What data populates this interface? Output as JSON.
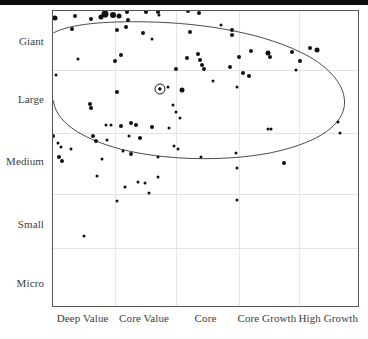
{
  "chart_data": {
    "type": "scatter",
    "title": "",
    "subtitle": "",
    "xlabel": "",
    "ylabel": "",
    "x_tick_labels": [
      "Deep Value",
      "Core Value",
      "Core",
      "Core Growth",
      "High Growth"
    ],
    "y_tick_labels": [
      "Giant",
      "Large",
      "Medium",
      "Small",
      "Micro"
    ],
    "grid": true,
    "legend_position": "none",
    "xlim": [
      0,
      5
    ],
    "ylim": [
      0,
      5
    ],
    "annotations": [
      {
        "name": "ownership-zone-ellipse",
        "shape": "ellipse",
        "description": "Open curve outlining holdings concentration across Giant/Large caps"
      },
      {
        "name": "highlighted-holding",
        "shape": "ring-marker",
        "x": 1.75,
        "y": 3.68,
        "description": "Circled data point marking the selected security"
      }
    ],
    "points": [
      {
        "x": 0.04,
        "y": 4.88,
        "size": 5
      },
      {
        "x": 0.36,
        "y": 4.92,
        "size": 4
      },
      {
        "x": 0.31,
        "y": 4.7,
        "size": 4
      },
      {
        "x": 0.62,
        "y": 4.86,
        "size": 4
      },
      {
        "x": 0.78,
        "y": 4.9,
        "size": 5
      },
      {
        "x": 0.85,
        "y": 4.95,
        "size": 7
      },
      {
        "x": 0.99,
        "y": 4.93,
        "size": 6
      },
      {
        "x": 1.08,
        "y": 4.92,
        "size": 5
      },
      {
        "x": 1.22,
        "y": 4.99,
        "size": 4
      },
      {
        "x": 1.23,
        "y": 4.84,
        "size": 4
      },
      {
        "x": 1.52,
        "y": 4.98,
        "size": 4
      },
      {
        "x": 1.72,
        "y": 4.99,
        "size": 4
      },
      {
        "x": 1.73,
        "y": 4.93,
        "size": 3
      },
      {
        "x": 2.22,
        "y": 5.0,
        "size": 4
      },
      {
        "x": 2.4,
        "y": 4.96,
        "size": 4
      },
      {
        "x": 1.05,
        "y": 4.68,
        "size": 4
      },
      {
        "x": 1.2,
        "y": 4.73,
        "size": 4
      },
      {
        "x": 1.48,
        "y": 4.62,
        "size": 4
      },
      {
        "x": 2.25,
        "y": 4.64,
        "size": 4
      },
      {
        "x": 2.75,
        "y": 4.76,
        "size": 3
      },
      {
        "x": 2.93,
        "y": 4.68,
        "size": 4
      },
      {
        "x": 2.94,
        "y": 4.6,
        "size": 4
      },
      {
        "x": 1.62,
        "y": 4.52,
        "size": 3
      },
      {
        "x": 0.41,
        "y": 4.18,
        "size": 3
      },
      {
        "x": 1.02,
        "y": 4.15,
        "size": 4
      },
      {
        "x": 1.12,
        "y": 4.25,
        "size": 4
      },
      {
        "x": 2.2,
        "y": 4.2,
        "size": 4
      },
      {
        "x": 2.38,
        "y": 4.27,
        "size": 4
      },
      {
        "x": 2.41,
        "y": 4.17,
        "size": 4
      },
      {
        "x": 2.44,
        "y": 4.08,
        "size": 4
      },
      {
        "x": 2.48,
        "y": 4.02,
        "size": 4
      },
      {
        "x": 3.05,
        "y": 4.22,
        "size": 4
      },
      {
        "x": 3.25,
        "y": 4.32,
        "size": 4
      },
      {
        "x": 3.52,
        "y": 4.29,
        "size": 5
      },
      {
        "x": 3.55,
        "y": 4.22,
        "size": 4
      },
      {
        "x": 3.92,
        "y": 4.3,
        "size": 4
      },
      {
        "x": 4.22,
        "y": 4.37,
        "size": 4
      },
      {
        "x": 4.33,
        "y": 4.34,
        "size": 5
      },
      {
        "x": 4.05,
        "y": 4.15,
        "size": 4
      },
      {
        "x": 1.75,
        "y": 3.68,
        "size": 3
      },
      {
        "x": 2.02,
        "y": 4.02,
        "size": 4
      },
      {
        "x": 2.9,
        "y": 4.05,
        "size": 4
      },
      {
        "x": 3.12,
        "y": 3.95,
        "size": 4
      },
      {
        "x": 3.22,
        "y": 3.9,
        "size": 4
      },
      {
        "x": 3.98,
        "y": 4.0,
        "size": 3
      },
      {
        "x": 2.62,
        "y": 3.82,
        "size": 3
      },
      {
        "x": 1.05,
        "y": 3.62,
        "size": 4
      },
      {
        "x": 1.88,
        "y": 3.72,
        "size": 3
      },
      {
        "x": 2.12,
        "y": 3.66,
        "size": 5
      },
      {
        "x": 3.02,
        "y": 3.72,
        "size": 3
      },
      {
        "x": 0.05,
        "y": 3.92,
        "size": 3
      },
      {
        "x": 0.6,
        "y": 3.42,
        "size": 4
      },
      {
        "x": 0.63,
        "y": 3.36,
        "size": 4
      },
      {
        "x": 1.97,
        "y": 3.4,
        "size": 3
      },
      {
        "x": 2.02,
        "y": 3.28,
        "size": 3
      },
      {
        "x": 0.87,
        "y": 3.06,
        "size": 3
      },
      {
        "x": 0.95,
        "y": 3.06,
        "size": 3
      },
      {
        "x": 1.12,
        "y": 3.05,
        "size": 4
      },
      {
        "x": 1.28,
        "y": 3.1,
        "size": 4
      },
      {
        "x": 1.36,
        "y": 3.06,
        "size": 4
      },
      {
        "x": 1.62,
        "y": 3.04,
        "size": 4
      },
      {
        "x": 1.9,
        "y": 3.02,
        "size": 3
      },
      {
        "x": 2.08,
        "y": 3.18,
        "size": 3
      },
      {
        "x": 3.52,
        "y": 3.0,
        "size": 3
      },
      {
        "x": 3.58,
        "y": 3.0,
        "size": 3
      },
      {
        "x": 4.68,
        "y": 3.12,
        "size": 3
      },
      {
        "x": 4.7,
        "y": 2.93,
        "size": 3
      },
      {
        "x": 0.0,
        "y": 2.88,
        "size": 4
      },
      {
        "x": 0.08,
        "y": 2.76,
        "size": 3
      },
      {
        "x": 0.13,
        "y": 2.7,
        "size": 3
      },
      {
        "x": 0.3,
        "y": 2.66,
        "size": 3
      },
      {
        "x": 0.66,
        "y": 2.88,
        "size": 4
      },
      {
        "x": 0.7,
        "y": 2.8,
        "size": 4
      },
      {
        "x": 0.88,
        "y": 2.82,
        "size": 3
      },
      {
        "x": 1.25,
        "y": 2.88,
        "size": 3
      },
      {
        "x": 1.42,
        "y": 2.84,
        "size": 4
      },
      {
        "x": 1.98,
        "y": 2.72,
        "size": 3
      },
      {
        "x": 2.05,
        "y": 2.66,
        "size": 3
      },
      {
        "x": 1.15,
        "y": 2.62,
        "size": 3
      },
      {
        "x": 1.28,
        "y": 2.58,
        "size": 4
      },
      {
        "x": 0.1,
        "y": 2.52,
        "size": 4
      },
      {
        "x": 0.14,
        "y": 2.46,
        "size": 4
      },
      {
        "x": 0.8,
        "y": 2.5,
        "size": 3
      },
      {
        "x": 1.72,
        "y": 2.52,
        "size": 3
      },
      {
        "x": 2.42,
        "y": 2.52,
        "size": 3
      },
      {
        "x": 3.0,
        "y": 2.6,
        "size": 3
      },
      {
        "x": 3.02,
        "y": 2.34,
        "size": 3
      },
      {
        "x": 3.78,
        "y": 2.42,
        "size": 4
      },
      {
        "x": 0.72,
        "y": 2.2,
        "size": 3
      },
      {
        "x": 1.72,
        "y": 2.18,
        "size": 3
      },
      {
        "x": 1.18,
        "y": 2.02,
        "size": 3
      },
      {
        "x": 1.4,
        "y": 2.1,
        "size": 3
      },
      {
        "x": 1.5,
        "y": 2.08,
        "size": 3
      },
      {
        "x": 1.58,
        "y": 1.92,
        "size": 3
      },
      {
        "x": 1.05,
        "y": 1.78,
        "size": 3
      },
      {
        "x": 3.02,
        "y": 1.8,
        "size": 3
      },
      {
        "x": 0.5,
        "y": 1.18,
        "size": 3
      }
    ]
  },
  "axes": {
    "y_ticks": [
      {
        "label": "Giant",
        "pos_pct": 10.4
      },
      {
        "label": "Large",
        "pos_pct": 30.0
      },
      {
        "label": "Medium",
        "pos_pct": 51.0
      },
      {
        "label": "Small",
        "pos_pct": 72.0
      },
      {
        "label": "Micro",
        "pos_pct": 92.0
      }
    ],
    "x_ticks": [
      {
        "label": "Deep Value",
        "pos_pct": 10.0
      },
      {
        "label": "Core Value",
        "pos_pct": 30.0
      },
      {
        "label": "Core",
        "pos_pct": 50.0
      },
      {
        "label": "Core Growth",
        "pos_pct": 70.0
      },
      {
        "label": "High Growth",
        "pos_pct": 90.0
      }
    ],
    "h_gridlines_pct": [
      20.0,
      41.5,
      62.0,
      80.5
    ],
    "v_gridlines_pct": [
      20.2,
      40.4,
      60.9,
      80.8
    ]
  },
  "colors": {
    "dot": "#101010",
    "grid": "#e2e2e2",
    "frame": "#555555",
    "ellipse": "#4a4a4a",
    "label_text": "#3d3d3d",
    "top_bar": "#0d0d0d"
  }
}
